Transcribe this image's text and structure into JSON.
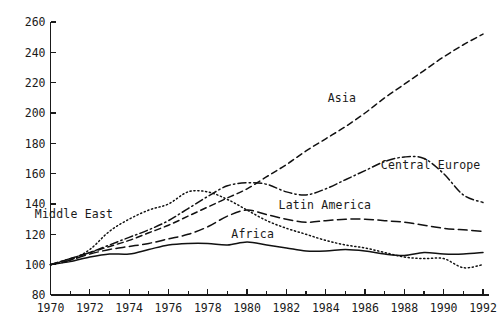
{
  "chart_data": {
    "type": "line",
    "title": "",
    "subtitle": "",
    "xlabel": "",
    "ylabel": "",
    "xlim": [
      1970,
      1992
    ],
    "ylim": [
      80,
      260
    ],
    "grid": false,
    "legend_position": "inline-annotations",
    "y_ticks": [
      80,
      100,
      120,
      140,
      160,
      180,
      200,
      220,
      240,
      260
    ],
    "x_ticks_major": [
      1970,
      1972,
      1974,
      1976,
      1978,
      1980,
      1982,
      1984,
      1986,
      1988,
      1990,
      1992
    ],
    "x_ticks_minor": [
      1971,
      1973,
      1975,
      1977,
      1979,
      1981,
      1983,
      1985,
      1987,
      1989,
      1991
    ],
    "x": [
      1970,
      1971,
      1972,
      1973,
      1974,
      1975,
      1976,
      1977,
      1978,
      1979,
      1980,
      1981,
      1982,
      1983,
      1984,
      1985,
      1986,
      1987,
      1988,
      1989,
      1990,
      1991,
      1992
    ],
    "series": [
      {
        "name": "Africa",
        "style": "solid",
        "label_x": 1979.2,
        "label_y": 117.5,
        "values": [
          100,
          102,
          105,
          107,
          107,
          110,
          113,
          114,
          114,
          113,
          115,
          113,
          111,
          109,
          109,
          110,
          109,
          107,
          106,
          108,
          107,
          107,
          108
        ]
      },
      {
        "name": "Middle East",
        "style": "dotted",
        "label_x": 1969.2,
        "label_y": 130.5,
        "values": [
          100,
          103,
          110,
          122,
          130,
          136,
          140,
          148,
          148,
          143,
          136,
          129,
          124,
          120,
          116,
          113,
          111,
          108,
          105,
          104,
          104,
          98,
          100
        ]
      },
      {
        "name": "Latin America",
        "style": "longdash",
        "label_x": 1981.6,
        "label_y": 137.0,
        "values": [
          100,
          103,
          107,
          110,
          112,
          114,
          117,
          120,
          125,
          132,
          136,
          133,
          130,
          128,
          129,
          130,
          130,
          129,
          128,
          126,
          124,
          123,
          122
        ]
      },
      {
        "name": "Central Europe",
        "style": "dashdot",
        "label_x": 1986.8,
        "label_y": 163.0,
        "values": [
          100,
          104,
          108,
          113,
          118,
          123,
          129,
          137,
          145,
          152,
          154,
          153,
          148,
          146,
          150,
          156,
          162,
          168,
          171,
          170,
          160,
          146,
          141
        ]
      },
      {
        "name": "Asia",
        "style": "dashed",
        "label_x": 1984.1,
        "label_y": 207.0,
        "values": [
          100,
          104,
          108,
          112,
          116,
          121,
          126,
          132,
          138,
          144,
          150,
          158,
          166,
          175,
          183,
          191,
          200,
          210,
          219,
          228,
          237,
          245,
          252
        ]
      }
    ]
  },
  "axes": {
    "y_tick_labels": [
      "80",
      "100",
      "120",
      "140",
      "160",
      "180",
      "200",
      "220",
      "240",
      "260"
    ],
    "x_tick_labels": [
      "1970",
      "1972",
      "1974",
      "1976",
      "1978",
      "1980",
      "1982",
      "1984",
      "1986",
      "1988",
      "1990",
      "1992"
    ]
  },
  "colors": {
    "line": "#111111",
    "axis": "#1a1a1a",
    "background": "#ffffff",
    "text": "#1a1a1a"
  }
}
